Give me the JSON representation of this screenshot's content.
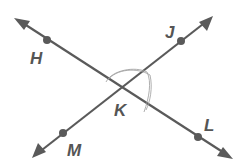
{
  "diagram": {
    "color": "#5a5a5a",
    "lines": [
      {
        "name": "HL",
        "from": [
          15,
          18
        ],
        "to": [
          232,
          158
        ]
      },
      {
        "name": "MJ",
        "from": [
          33,
          157
        ],
        "to": [
          212,
          17
        ]
      }
    ],
    "points": [
      {
        "id": "H",
        "label": "H",
        "x": 47,
        "y": 40,
        "lx": 30,
        "ly": 64
      },
      {
        "id": "J",
        "label": "J",
        "x": 181,
        "y": 41,
        "lx": 164,
        "ly": 38
      },
      {
        "id": "K",
        "label": "K",
        "x": 123,
        "y": 88,
        "lx": 114,
        "ly": 116
      },
      {
        "id": "L",
        "label": "L",
        "x": 198,
        "y": 137,
        "lx": 203,
        "ly": 130
      },
      {
        "id": "M",
        "label": "M",
        "x": 63,
        "y": 133,
        "lx": 67,
        "ly": 156
      }
    ]
  },
  "labels": {
    "H": "H",
    "J": "J",
    "K": "K",
    "L": "L",
    "M": "M"
  }
}
